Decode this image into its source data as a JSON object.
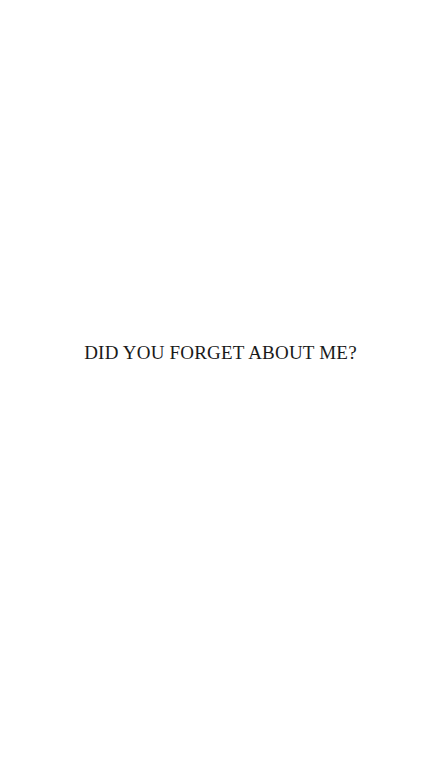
{
  "page": {
    "background": "#ffffff",
    "caption": "DID YOU FORGET ABOUT ME?",
    "text_color": "#1a1a1a"
  }
}
